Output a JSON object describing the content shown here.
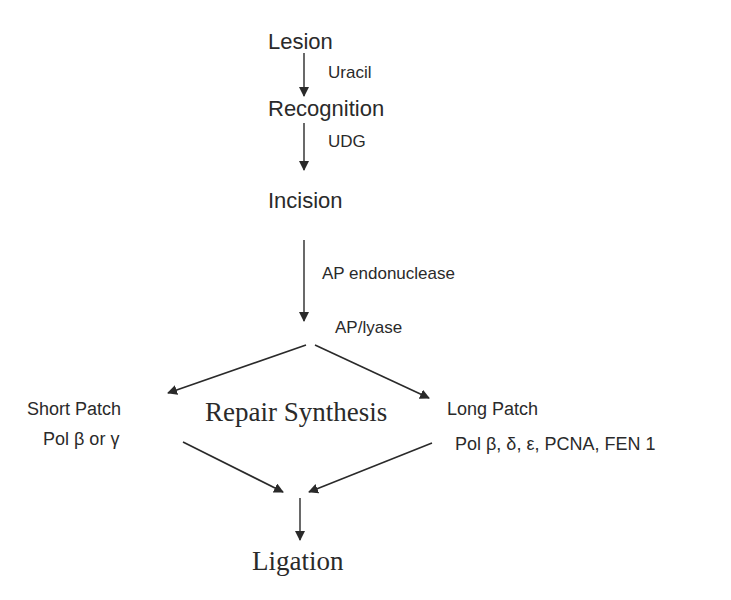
{
  "diagram": {
    "type": "flowchart",
    "title": "",
    "steps": {
      "lesion": "Lesion",
      "recognition": "Recognition",
      "incision": "Incision",
      "repair_synthesis": "Repair Synthesis",
      "ligation": "Ligation"
    },
    "edge_labels": {
      "lesion_to_recognition": "Uracil",
      "recognition_to_incision": "UDG",
      "incision_to_branch_1": "AP endonuclease",
      "incision_to_branch_2": "AP/lyase"
    },
    "branches": {
      "short_patch": {
        "label": "Short Patch",
        "enzymes": "Pol β or γ"
      },
      "long_patch": {
        "label": "Long Patch",
        "enzymes": "Pol β, δ, ε, PCNA, FEN 1"
      }
    },
    "colors": {
      "ink": "#2a2a2a",
      "background": "#ffffff"
    }
  }
}
